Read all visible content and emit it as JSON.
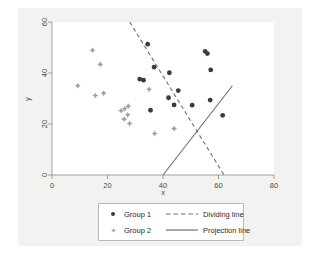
{
  "figure": {
    "background_color": "#f2f2f1",
    "plot_background_color": "#ffffff",
    "axis_color": "#8a8a8a",
    "text_color": "#4a4a4a"
  },
  "chart_data": {
    "type": "scatter",
    "title": "",
    "xlabel": "x",
    "ylabel": "y",
    "xlim": [
      0,
      80
    ],
    "ylim": [
      0,
      60
    ],
    "xticks": [
      0,
      20,
      40,
      60,
      80
    ],
    "yticks": [
      0,
      20,
      40,
      60
    ],
    "xtick_labels": [
      "0",
      "20",
      "40",
      "60",
      "80"
    ],
    "ytick_labels": [
      "0",
      "20",
      "40",
      "60"
    ],
    "grid": false,
    "legend_position": "below-center",
    "series": [
      {
        "name": "Group 1",
        "marker": "filled-circle",
        "color": "#3a3a42",
        "points": [
          [
            34.5,
            51.3
          ],
          [
            55.2,
            48.5
          ],
          [
            56.0,
            47.6
          ],
          [
            36.8,
            42.3
          ],
          [
            57.2,
            41.2
          ],
          [
            42.3,
            40.1
          ],
          [
            31.6,
            37.6
          ],
          [
            33.0,
            37.2
          ],
          [
            45.5,
            33.1
          ],
          [
            42.0,
            30.3
          ],
          [
            57.0,
            29.4
          ],
          [
            44.0,
            27.5
          ],
          [
            50.5,
            27.4
          ],
          [
            35.5,
            25.4
          ],
          [
            61.5,
            23.4
          ]
        ]
      },
      {
        "name": "Group 2",
        "marker": "diamond-star",
        "color": "#a0a0ab",
        "points": [
          [
            14.6,
            48.9
          ],
          [
            17.4,
            43.4
          ],
          [
            9.3,
            35.0
          ],
          [
            35.0,
            33.6
          ],
          [
            18.6,
            32.1
          ],
          [
            15.6,
            31.2
          ],
          [
            27.5,
            27.0
          ],
          [
            26.2,
            26.0
          ],
          [
            24.9,
            25.2
          ],
          [
            27.3,
            23.6
          ],
          [
            26.0,
            21.9
          ],
          [
            28.0,
            20.2
          ],
          [
            44.0,
            18.2
          ],
          [
            37.0,
            16.3
          ]
        ]
      }
    ],
    "lines": [
      {
        "name": "Dividing line",
        "style": "dashed",
        "color": "#6e6e78",
        "from": [
          28.0,
          60.0
        ],
        "to": [
          62.0,
          0.0
        ]
      },
      {
        "name": "Projection line",
        "style": "solid",
        "color": "#6e6e78",
        "from": [
          40.0,
          0.0
        ],
        "to": [
          65.0,
          35.0
        ]
      }
    ]
  },
  "legend": {
    "entries": [
      {
        "label": "Group 1",
        "key": "marker-circle"
      },
      {
        "label": "Group 2",
        "key": "marker-diamond"
      },
      {
        "label": "Dividing line",
        "key": "line-dashed"
      },
      {
        "label": "Projection line",
        "key": "line-solid"
      }
    ]
  }
}
